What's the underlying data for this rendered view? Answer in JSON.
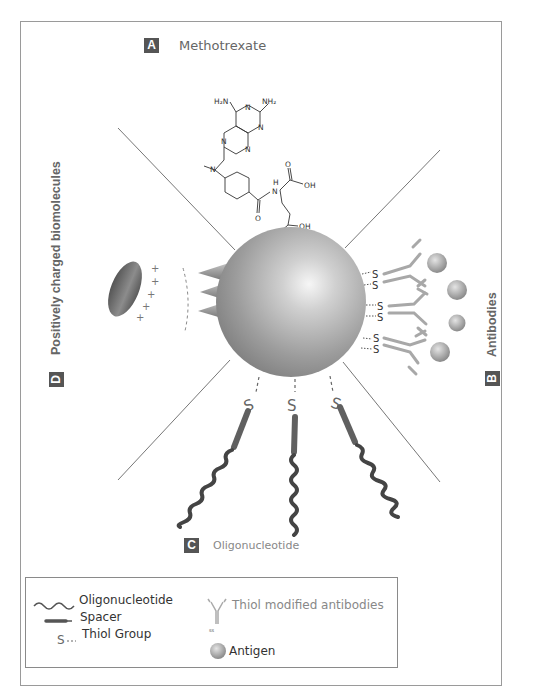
{
  "figure": {
    "sections": {
      "A": {
        "badge": "A",
        "label": "Methotrexate"
      },
      "B": {
        "badge": "B",
        "label": "Antibodies"
      },
      "C": {
        "badge": "C",
        "label": "Oligonucleotide"
      },
      "D": {
        "badge": "D",
        "label": "Positively charged biomolecules"
      }
    },
    "molecule": {
      "name": "Methotrexate",
      "atoms": {
        "nh2_left": "H₂N",
        "nh2_right": "NH₂",
        "n": "N",
        "h": "H",
        "o": "O",
        "oh": "OH"
      }
    },
    "thiol_symbol": "S",
    "charge_symbol": "+",
    "colors": {
      "sphere": "#9a9a9a",
      "badge": "#555555",
      "text": "#777777",
      "strand": "#4a4a4a",
      "antibody": "#a8a8a8",
      "antigen": "#b0b0b0"
    }
  },
  "legend": {
    "items": [
      {
        "icon": "wavy-line-icon",
        "label": "Oligonucleotide"
      },
      {
        "icon": "spacer-bar-icon",
        "label": "Spacer"
      },
      {
        "icon": "thiol-icon",
        "symbol": "S--",
        "label": "Thiol Group"
      },
      {
        "icon": "antibody-icon",
        "label": "Thiol modified antibodies"
      },
      {
        "icon": "antigen-icon",
        "label": "Antigen"
      }
    ]
  }
}
